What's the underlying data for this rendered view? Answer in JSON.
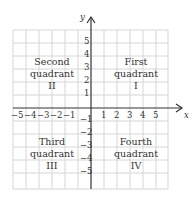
{
  "axes": {
    "x_label": "x",
    "y_label": "y"
  },
  "x_ticks": [
    "−5",
    "−4",
    "−3",
    "−2",
    "−1",
    "1",
    "2",
    "3",
    "4",
    "5"
  ],
  "y_ticks": [
    "5",
    "4",
    "3",
    "2",
    "1",
    "−1",
    "−2",
    "−3",
    "−4",
    "−5"
  ],
  "quadrants": [
    {
      "name": "First",
      "word": "quadrant",
      "numeral": "I"
    },
    {
      "name": "Second",
      "word": "quadrant",
      "numeral": "II"
    },
    {
      "name": "Third",
      "word": "quadrant",
      "numeral": "III"
    },
    {
      "name": "Fourth",
      "word": "quadrant",
      "numeral": "IV"
    }
  ],
  "colors": {
    "grid": "#d4d4d4",
    "axis": "#333333",
    "text": "#333333"
  }
}
